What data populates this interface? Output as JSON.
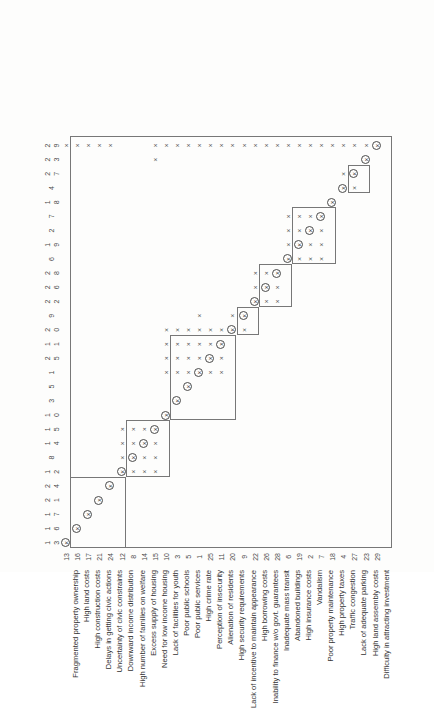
{
  "figure": {
    "orientation": "rotated-90",
    "type": "reachability-matrix",
    "caption": ""
  },
  "matrix": {
    "row_ids": [
      13,
      16,
      17,
      21,
      24,
      12,
      8,
      14,
      15,
      10,
      3,
      5,
      1,
      25,
      11,
      20,
      9,
      22,
      26,
      28,
      6,
      19,
      2,
      7,
      18,
      4,
      27,
      23,
      29
    ],
    "col_ids": [
      13,
      16,
      17,
      21,
      24,
      12,
      8,
      14,
      15,
      10,
      3,
      5,
      1,
      25,
      11,
      20,
      9,
      22,
      26,
      28,
      6,
      19,
      2,
      7,
      18,
      4,
      27,
      23,
      29
    ],
    "row_labels": [
      "Fragmented property ownership",
      "High land costs",
      "High construction costs",
      "Delays in getting civic actions",
      "Uncertainty of civic constraints",
      "Downward income distribution",
      "High number of families on welfare",
      "Excess supply of housing",
      "Need for low income housing",
      "Lack of facilities for youth",
      "Poor public schools",
      "Poor public services",
      "High crime rate",
      "Perception of insecurity",
      "Alienation of residents",
      "High security requirements",
      "Lack of incentive to maintain appearance",
      "High borrowing costs",
      "Inability to finance w/o govt. guarantees",
      "Inadequate mass transit",
      "Abandoned buildings",
      "High insurance costs",
      "Vandalism",
      "Poor property maintenance",
      "High property taxes",
      "Traffic congestion",
      "Lack of adequate parking",
      "High land assembly costs",
      "Difficulty in attracting investment"
    ],
    "mark_symbol": "×",
    "diagonal_symbol": "×",
    "cells": [
      [
        1,
        0,
        0,
        0,
        0,
        0,
        0,
        0,
        0,
        0,
        0,
        0,
        0,
        0,
        0,
        0,
        0,
        0,
        0,
        0,
        0,
        0,
        0,
        0,
        0,
        0,
        0,
        0,
        1
      ],
      [
        0,
        1,
        0,
        0,
        0,
        0,
        0,
        0,
        0,
        0,
        0,
        0,
        0,
        0,
        0,
        0,
        0,
        0,
        0,
        0,
        0,
        0,
        0,
        0,
        0,
        0,
        0,
        0,
        1
      ],
      [
        0,
        0,
        1,
        0,
        0,
        0,
        0,
        0,
        0,
        0,
        0,
        0,
        0,
        0,
        0,
        0,
        0,
        0,
        0,
        0,
        0,
        0,
        0,
        0,
        0,
        0,
        0,
        0,
        1
      ],
      [
        0,
        0,
        0,
        1,
        0,
        0,
        0,
        0,
        0,
        0,
        0,
        0,
        0,
        0,
        0,
        0,
        0,
        0,
        0,
        0,
        0,
        0,
        0,
        0,
        0,
        0,
        0,
        0,
        1
      ],
      [
        0,
        0,
        0,
        0,
        1,
        0,
        0,
        0,
        0,
        0,
        0,
        0,
        0,
        0,
        0,
        0,
        0,
        0,
        0,
        0,
        0,
        0,
        0,
        0,
        0,
        0,
        0,
        0,
        1
      ],
      [
        0,
        0,
        0,
        0,
        0,
        1,
        1,
        1,
        1,
        0,
        0,
        0,
        0,
        0,
        0,
        0,
        0,
        0,
        0,
        0,
        0,
        0,
        0,
        0,
        0,
        0,
        0,
        0,
        0
      ],
      [
        0,
        0,
        0,
        0,
        0,
        1,
        1,
        1,
        1,
        0,
        0,
        0,
        0,
        0,
        0,
        0,
        0,
        0,
        0,
        0,
        0,
        0,
        0,
        0,
        0,
        0,
        0,
        0,
        0
      ],
      [
        0,
        0,
        0,
        0,
        0,
        1,
        1,
        1,
        1,
        0,
        0,
        0,
        0,
        0,
        0,
        0,
        0,
        0,
        0,
        0,
        0,
        0,
        0,
        0,
        0,
        0,
        0,
        0,
        0
      ],
      [
        0,
        0,
        0,
        0,
        0,
        1,
        1,
        1,
        1,
        0,
        0,
        0,
        0,
        0,
        0,
        0,
        0,
        0,
        0,
        0,
        0,
        0,
        0,
        0,
        0,
        0,
        0,
        1,
        1
      ],
      [
        0,
        0,
        0,
        0,
        0,
        0,
        0,
        0,
        0,
        1,
        0,
        0,
        1,
        1,
        1,
        1,
        0,
        0,
        0,
        0,
        0,
        0,
        0,
        0,
        0,
        0,
        0,
        0,
        1
      ],
      [
        0,
        0,
        0,
        0,
        0,
        0,
        0,
        0,
        0,
        0,
        1,
        0,
        1,
        1,
        1,
        1,
        0,
        0,
        0,
        0,
        0,
        0,
        0,
        0,
        0,
        0,
        0,
        0,
        1
      ],
      [
        0,
        0,
        0,
        0,
        0,
        0,
        0,
        0,
        0,
        0,
        0,
        1,
        1,
        1,
        1,
        1,
        0,
        0,
        0,
        0,
        0,
        0,
        0,
        0,
        0,
        0,
        0,
        0,
        1
      ],
      [
        0,
        0,
        0,
        0,
        0,
        0,
        0,
        0,
        0,
        0,
        0,
        0,
        1,
        1,
        1,
        1,
        1,
        0,
        0,
        0,
        0,
        0,
        0,
        0,
        0,
        0,
        0,
        0,
        1
      ],
      [
        0,
        0,
        0,
        0,
        0,
        0,
        0,
        0,
        0,
        0,
        0,
        0,
        1,
        1,
        1,
        1,
        0,
        0,
        0,
        0,
        0,
        0,
        0,
        0,
        0,
        0,
        0,
        0,
        1
      ],
      [
        0,
        0,
        0,
        0,
        0,
        0,
        0,
        0,
        0,
        0,
        0,
        0,
        1,
        1,
        1,
        1,
        0,
        0,
        0,
        0,
        0,
        0,
        0,
        0,
        0,
        0,
        0,
        0,
        1
      ],
      [
        0,
        0,
        0,
        0,
        0,
        0,
        0,
        0,
        0,
        0,
        0,
        0,
        0,
        0,
        0,
        1,
        1,
        0,
        0,
        0,
        0,
        0,
        0,
        0,
        0,
        0,
        0,
        0,
        1
      ],
      [
        0,
        0,
        0,
        0,
        0,
        0,
        0,
        0,
        0,
        0,
        0,
        0,
        0,
        0,
        0,
        1,
        1,
        0,
        0,
        0,
        0,
        0,
        0,
        0,
        0,
        0,
        0,
        0,
        1
      ],
      [
        0,
        0,
        0,
        0,
        0,
        0,
        0,
        0,
        0,
        0,
        0,
        0,
        0,
        0,
        0,
        0,
        0,
        1,
        1,
        1,
        0,
        0,
        0,
        0,
        0,
        0,
        0,
        0,
        1
      ],
      [
        0,
        0,
        0,
        0,
        0,
        0,
        0,
        0,
        0,
        0,
        0,
        0,
        0,
        0,
        0,
        0,
        0,
        1,
        1,
        1,
        0,
        0,
        0,
        0,
        0,
        0,
        0,
        0,
        1
      ],
      [
        0,
        0,
        0,
        0,
        0,
        0,
        0,
        0,
        0,
        0,
        0,
        0,
        0,
        0,
        0,
        0,
        0,
        1,
        1,
        1,
        0,
        0,
        0,
        0,
        0,
        0,
        0,
        0,
        1
      ],
      [
        0,
        0,
        0,
        0,
        0,
        0,
        0,
        0,
        0,
        0,
        0,
        0,
        0,
        0,
        0,
        0,
        0,
        0,
        0,
        0,
        1,
        1,
        1,
        1,
        0,
        0,
        0,
        0,
        1
      ],
      [
        0,
        0,
        0,
        0,
        0,
        0,
        0,
        0,
        0,
        0,
        0,
        0,
        0,
        0,
        0,
        0,
        0,
        0,
        0,
        0,
        1,
        1,
        1,
        1,
        0,
        0,
        0,
        0,
        1
      ],
      [
        0,
        0,
        0,
        0,
        0,
        0,
        0,
        0,
        0,
        0,
        0,
        0,
        0,
        0,
        0,
        0,
        0,
        0,
        0,
        0,
        1,
        1,
        1,
        1,
        0,
        0,
        0,
        0,
        1
      ],
      [
        0,
        0,
        0,
        0,
        0,
        0,
        0,
        0,
        0,
        0,
        0,
        0,
        0,
        0,
        0,
        0,
        0,
        0,
        0,
        0,
        1,
        1,
        1,
        1,
        0,
        0,
        0,
        0,
        1
      ],
      [
        0,
        0,
        0,
        0,
        0,
        0,
        0,
        0,
        0,
        0,
        0,
        0,
        0,
        0,
        0,
        0,
        0,
        0,
        0,
        0,
        0,
        0,
        0,
        0,
        1,
        0,
        0,
        0,
        1
      ],
      [
        0,
        0,
        0,
        0,
        0,
        0,
        0,
        0,
        0,
        0,
        0,
        0,
        0,
        0,
        0,
        0,
        0,
        0,
        0,
        0,
        0,
        0,
        0,
        0,
        0,
        1,
        1,
        0,
        1
      ],
      [
        0,
        0,
        0,
        0,
        0,
        0,
        0,
        0,
        0,
        0,
        0,
        0,
        0,
        0,
        0,
        0,
        0,
        0,
        0,
        0,
        0,
        0,
        0,
        0,
        0,
        1,
        1,
        0,
        1
      ],
      [
        0,
        0,
        0,
        0,
        0,
        0,
        0,
        0,
        0,
        0,
        0,
        0,
        0,
        0,
        0,
        0,
        0,
        0,
        0,
        0,
        0,
        0,
        0,
        0,
        0,
        0,
        0,
        1,
        1
      ],
      [
        0,
        0,
        0,
        0,
        0,
        0,
        0,
        0,
        0,
        0,
        0,
        0,
        0,
        0,
        0,
        0,
        0,
        0,
        0,
        0,
        0,
        0,
        0,
        0,
        0,
        0,
        0,
        0,
        1
      ]
    ],
    "partitions": [
      {
        "start": 0,
        "end": 28,
        "name": "outer-frame"
      },
      {
        "start": 0,
        "end": 4,
        "name": "level-block-1"
      },
      {
        "start": 5,
        "end": 8,
        "name": "level-block-2"
      },
      {
        "start": 9,
        "end": 14,
        "name": "level-block-3"
      },
      {
        "start": 15,
        "end": 16,
        "name": "level-block-4"
      },
      {
        "start": 17,
        "end": 19,
        "name": "level-block-5"
      },
      {
        "start": 20,
        "end": 23,
        "name": "level-block-6"
      },
      {
        "start": 25,
        "end": 26,
        "name": "level-block-7"
      }
    ]
  }
}
